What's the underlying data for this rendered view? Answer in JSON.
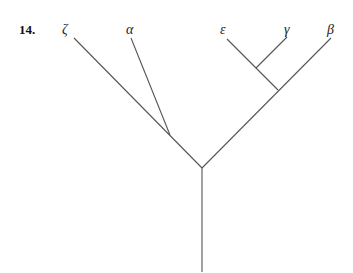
{
  "problem_number": "14.",
  "tree": {
    "type": "phylogenetic-tree",
    "taxa": [
      "ζ",
      "α",
      "ε",
      "γ",
      "β"
    ],
    "topology": "((ζ,α),((ε,γ),β))",
    "labels": {
      "zeta": "ζ",
      "alpha": "α",
      "epsilon": "ε",
      "gamma": "γ",
      "beta": "β"
    }
  },
  "style": {
    "line_color": "#555555"
  }
}
